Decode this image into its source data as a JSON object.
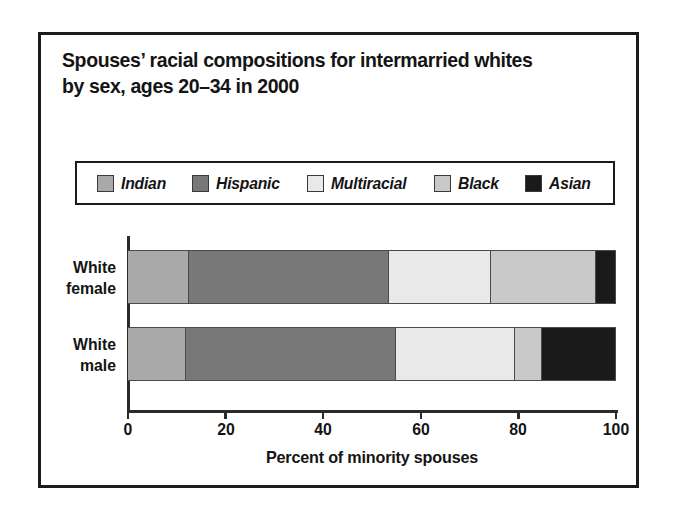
{
  "figure": {
    "title_line1": "Spouses’ racial compositions for intermarried whites",
    "title_line2": "by sex, ages 20–34 in 2000"
  },
  "chart_data": {
    "type": "bar",
    "orientation": "horizontal",
    "stacked": true,
    "normalized": true,
    "title": "Spouses’ racial compositions for intermarried whites by sex, ages 20–34 in 2000",
    "xlabel": "Percent of minority spouses",
    "ylabel": "",
    "xlim": [
      0,
      100
    ],
    "xticks": [
      0,
      20,
      40,
      60,
      80,
      100
    ],
    "xticklabels": [
      "0",
      "20",
      "40",
      "60",
      "80",
      "100"
    ],
    "grid": false,
    "legend_position": "above-plot",
    "categories": [
      "White female",
      "White male"
    ],
    "category_labels": [
      [
        "White",
        "female"
      ],
      [
        "White",
        "male"
      ]
    ],
    "series": [
      {
        "name": "Indian",
        "color": "#a9a9a9",
        "values": [
          12.5,
          12.0
        ]
      },
      {
        "name": "Hispanic",
        "color": "#787878",
        "values": [
          41.0,
          43.0
        ]
      },
      {
        "name": "Multiracial",
        "color": "#e9e9e9",
        "values": [
          21.0,
          24.5
        ]
      },
      {
        "name": "Black",
        "color": "#c9c9c9",
        "values": [
          21.5,
          5.5
        ]
      },
      {
        "name": "Asian",
        "color": "#1a1a1a",
        "values": [
          4.0,
          15.0
        ]
      }
    ],
    "cumulative_breakpoints": {
      "White female": [
        12.5,
        53.5,
        74.5,
        96.0,
        100.0
      ],
      "White male": [
        12.0,
        55.0,
        79.5,
        85.0,
        100.0
      ]
    }
  },
  "legend": {
    "items": [
      {
        "label": "Indian",
        "color": "#a9a9a9"
      },
      {
        "label": "Hispanic",
        "color": "#787878"
      },
      {
        "label": "Multiracial",
        "color": "#e9e9e9"
      },
      {
        "label": "Black",
        "color": "#c9c9c9"
      },
      {
        "label": "Asian",
        "color": "#1a1a1a"
      }
    ]
  },
  "axis": {
    "x_title": "Percent of minority spouses",
    "ticklabels": [
      "0",
      "20",
      "40",
      "60",
      "80",
      "100"
    ]
  }
}
